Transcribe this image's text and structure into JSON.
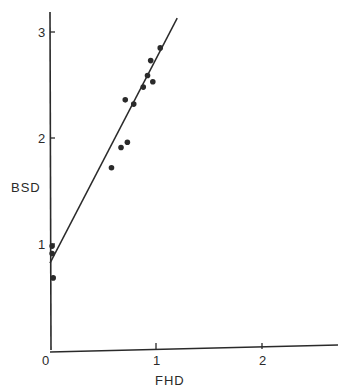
{
  "chart_data": {
    "type": "scatter",
    "title": "",
    "xlabel": "FHD",
    "ylabel": "BSD",
    "xlim": [
      0,
      2.7
    ],
    "ylim": [
      0,
      3.2
    ],
    "x_ticks": [
      {
        "value": 0,
        "label": "0"
      },
      {
        "value": 1,
        "label": "1"
      },
      {
        "value": 2,
        "label": "2"
      }
    ],
    "y_ticks": [
      {
        "value": 1,
        "label": "1"
      },
      {
        "value": 2,
        "label": "2"
      },
      {
        "value": 3,
        "label": "3"
      }
    ],
    "grid": false,
    "legend": null,
    "series": [
      {
        "name": "observations",
        "kind": "points",
        "points": [
          {
            "x": 1.04,
            "y": 2.85
          },
          {
            "x": 0.95,
            "y": 2.73
          },
          {
            "x": 0.92,
            "y": 2.59
          },
          {
            "x": 0.97,
            "y": 2.53
          },
          {
            "x": 0.88,
            "y": 2.48
          },
          {
            "x": 0.71,
            "y": 2.36
          },
          {
            "x": 0.79,
            "y": 2.32
          },
          {
            "x": 0.73,
            "y": 1.96
          },
          {
            "x": 0.67,
            "y": 1.91
          },
          {
            "x": 0.58,
            "y": 1.72
          },
          {
            "x": 0.02,
            "y": 0.98
          },
          {
            "x": 0.02,
            "y": 0.91
          },
          {
            "x": 0.03,
            "y": 0.68
          }
        ]
      },
      {
        "name": "regression-line",
        "kind": "line",
        "points": [
          {
            "x": 0.0,
            "y": 0.82
          },
          {
            "x": 1.2,
            "y": 3.13
          }
        ]
      }
    ]
  },
  "style": {
    "ink_color": "#2a2a2a",
    "background": "#ffffff"
  }
}
